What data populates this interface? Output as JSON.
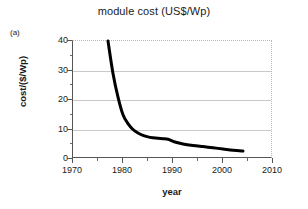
{
  "figure": {
    "panel_label": "(a)",
    "title": "module cost (US$/Wp)"
  },
  "axes": {
    "x_title": "year",
    "y_title": "cost/($/Wp)",
    "x_ticks": [
      "1970",
      "1980",
      "1990",
      "2000",
      "2010"
    ],
    "y_ticks": [
      "0",
      "10",
      "20",
      "30",
      "40"
    ]
  },
  "chart_data": {
    "type": "line",
    "title": "module cost (US$/Wp)",
    "xlabel": "year",
    "ylabel": "cost/($/Wp)",
    "xlim": [
      1970,
      2010
    ],
    "ylim": [
      0,
      40
    ],
    "xticks": [
      1970,
      1980,
      1990,
      2000,
      2010
    ],
    "yticks": [
      0,
      10,
      20,
      30,
      40
    ],
    "x_minor_tick_interval": 5,
    "grid": "horizontal-only",
    "legend": "none",
    "series": [
      {
        "name": "module cost",
        "color": "#000000",
        "line_width_px": 3,
        "x": [
          1977,
          1978,
          1979,
          1980,
          1981,
          1982,
          1983,
          1984,
          1985,
          1986,
          1987,
          1988,
          1989,
          1990,
          1991,
          1992,
          1994,
          1996,
          1998,
          2000,
          2002,
          2004
        ],
        "values": [
          40.0,
          29.0,
          21.0,
          15.0,
          12.0,
          10.0,
          8.8,
          8.0,
          7.5,
          7.2,
          7.0,
          6.9,
          6.7,
          6.0,
          5.5,
          5.1,
          4.6,
          4.2,
          3.8,
          3.4,
          3.0,
          2.7
        ]
      }
    ]
  }
}
